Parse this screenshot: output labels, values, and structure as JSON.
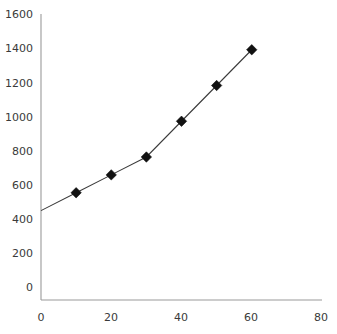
{
  "chart_data": {
    "type": "line",
    "title": "",
    "subtitle": "",
    "xlabel": "",
    "ylabel": "",
    "x": [
      0,
      10,
      20,
      30,
      40,
      50,
      60
    ],
    "values": [
      500,
      600,
      700,
      800,
      1000,
      1200,
      1400
    ],
    "marker_x": [
      10,
      20,
      30,
      40,
      50,
      60
    ],
    "marker_values": [
      600,
      700,
      800,
      1000,
      1200,
      1400
    ],
    "series": [
      {
        "name": "series-1",
        "x": [
          0,
          10,
          20,
          30,
          40,
          50,
          60
        ],
        "values": [
          500,
          600,
          700,
          800,
          1000,
          1200,
          1400
        ],
        "marker": "diamond",
        "color": "#111111"
      }
    ],
    "xlim": [
      0,
      80
    ],
    "ylim": [
      0,
      1600
    ],
    "xticks": [
      0,
      20,
      40,
      60,
      80
    ],
    "yticks": [
      0,
      200,
      400,
      600,
      800,
      1000,
      1200,
      1400,
      1600
    ],
    "grid": false,
    "legend": false,
    "legend_position": "none",
    "annotations": []
  },
  "axes": {
    "y_tick_labels": [
      "1600",
      "1400",
      "1200",
      "1000",
      "800",
      "600",
      "400",
      "200",
      "0"
    ],
    "x_tick_labels": [
      "0",
      "20",
      "40",
      "60",
      "80"
    ],
    "axis_color": "#9a9a9a",
    "line_color": "#3b3b3b",
    "marker_color": "#111111",
    "background": "#ffffff"
  }
}
